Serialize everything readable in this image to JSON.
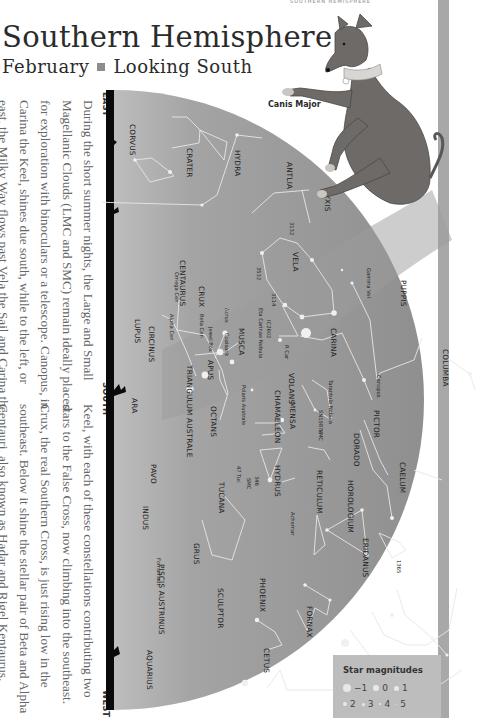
{
  "page": {
    "title": "Southern Hemisphere",
    "subtitle_month": "February",
    "subtitle_view": "Looking South",
    "running_header": "SOUTHERN HEMISPHERE"
  },
  "body_text": {
    "column_1": [
      "During the short summer nights, the Large and Small",
      "Magellanic Clouds (LMC and SMC) remain ideally placed",
      "for exploration with binoculars or a telescope. Canopus, in",
      "Carina the Keel, shines due south, while to the left, or",
      "east, the Milky Way flows past Vela the Sail and Carina the"
    ],
    "column_2": [
      "Keel, with each of these constellations contributing two",
      "stars to the False Cross, now climbing into the southeast.",
      "Crux, the real Southern Cross, is just rising  low in the",
      "southeast. Below it shine the stellar pair of Beta and Alpha",
      "Centauri, also known as Hadar and Rigel Kentaurus."
    ]
  },
  "chart": {
    "directions": {
      "east": "EAST",
      "south": "SOUTH",
      "west": "WEST"
    },
    "illustration_caption": "Canis Major",
    "colors": {
      "sky": "#9a9a9a",
      "sky_dark": "#8c8c8c",
      "horizon": "#0a0a0a",
      "lines": "#e6e6e6",
      "band": "#a8a8a8"
    },
    "constellations": [
      "CORVUS",
      "CRATER",
      "HYDRA",
      "ANTLIA",
      "PYXIS",
      "VELA",
      "PUPPIS",
      "CENTAURUS",
      "CRUX",
      "MUSCA",
      "CARINA",
      "COLUMBA",
      "LUPUS",
      "CIRCINUS",
      "APUS",
      "TRIANGULUM AUSTRALE",
      "VOLANS",
      "CHAMAELEON",
      "MENSA",
      "PICTOR",
      "DORADO",
      "CAELUM",
      "ARA",
      "OCTANS",
      "HYDRUS",
      "RETICULUM",
      "HOROLOGIUM",
      "ERIDANUS",
      "PAVO",
      "TUCANA",
      "INDUS",
      "GRUS",
      "PHOENIX",
      "FORNAX",
      "SCULPTOR",
      "PISCIS AUSTRINUS",
      "CETUS",
      "AQUARIUS"
    ],
    "objects": [
      "3132",
      "3532",
      "3114",
      "Gamma Vel",
      "Omega Cen",
      "Acrux",
      "Jewel Box",
      "Beta Cen",
      "Alpha Cen",
      "Coalsack",
      "IC2602",
      "Eta Carinae Nebula",
      "R Car",
      "Canopus",
      "Polaris Australe",
      "Tarantula Nebula",
      "SN1987A",
      "LMC",
      "346",
      "SMC",
      "47 Tuc",
      "Achernar",
      "1365",
      "Fomalhaut"
    ]
  },
  "legend": {
    "title": "Star magnitudes",
    "row1": [
      "−1",
      "0",
      "1"
    ],
    "row2": [
      "2",
      "3",
      "4",
      "5"
    ]
  }
}
